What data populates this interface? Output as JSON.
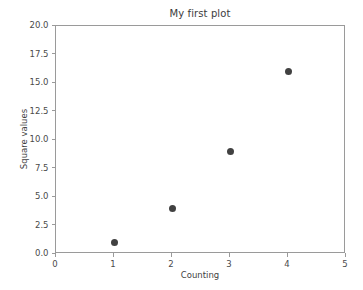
{
  "chart_data": {
    "type": "scatter",
    "title": "My first plot",
    "xlabel": "Counting",
    "ylabel": "Square values",
    "x": [
      1,
      2,
      3,
      4
    ],
    "values": [
      1,
      4,
      9,
      16
    ],
    "points": [
      {
        "x": 1,
        "y": 1
      },
      {
        "x": 2,
        "y": 4
      },
      {
        "x": 3,
        "y": 9
      },
      {
        "x": 4,
        "y": 16
      }
    ],
    "xlim": [
      0,
      5
    ],
    "ylim": [
      0,
      20
    ],
    "xticks": [
      "0",
      "1",
      "2",
      "3",
      "4",
      "5"
    ],
    "xtick_values": [
      0,
      1,
      2,
      3,
      4,
      5
    ],
    "yticks": [
      "0.0",
      "2.5",
      "5.0",
      "7.5",
      "10.0",
      "12.5",
      "15.0",
      "17.5",
      "20.0"
    ],
    "ytick_values": [
      0,
      2.5,
      5,
      7.5,
      10,
      12.5,
      15,
      17.5,
      20
    ],
    "grid": false,
    "legend": null,
    "marker_color": "#414141",
    "axis_color": "#9a9a9a",
    "background": "#ffffff"
  }
}
